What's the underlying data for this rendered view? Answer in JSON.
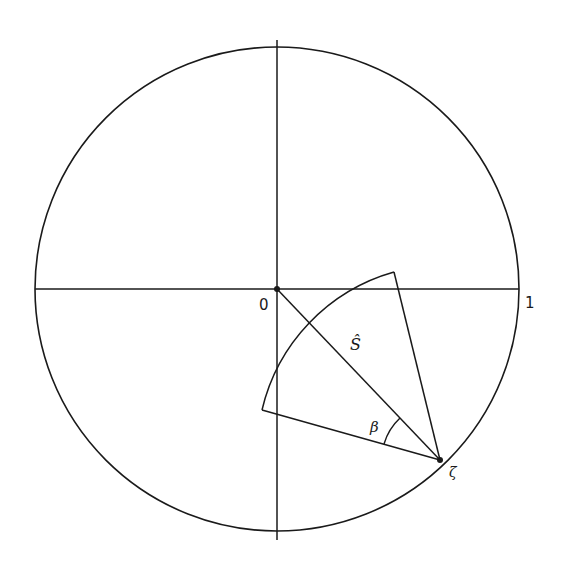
{
  "diagram": {
    "type": "geometric-figure",
    "colors": {
      "stroke": "#1a1a1a",
      "background": "#ffffff"
    },
    "unit_circle": {
      "cx": 277,
      "cy": 289,
      "r": 242
    },
    "axes": {
      "horizontal": {
        "x1": 35,
        "x2": 519,
        "y": 289
      },
      "vertical": {
        "x": 277,
        "y1": 40,
        "y2": 540
      }
    },
    "points": {
      "origin": {
        "x": 277,
        "y": 289,
        "label": "0"
      },
      "zeta": {
        "x": 440,
        "y": 460,
        "label": "ζ"
      }
    },
    "sector": {
      "apex": {
        "x": 440,
        "y": 460
      },
      "corner_upper": {
        "x": 394,
        "y": 272
      },
      "corner_lower": {
        "x": 262,
        "y": 410
      },
      "arc_radius": 188
    },
    "labels": {
      "origin": "0",
      "one": "1",
      "s_hat": "Ŝ",
      "beta": "β",
      "zeta": "ζ"
    }
  }
}
